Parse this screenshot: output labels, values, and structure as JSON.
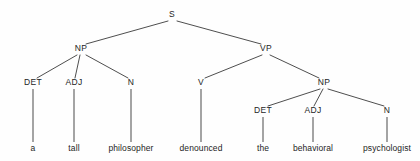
{
  "figure": {
    "sentence": "a tall philosopher denounced the behavioral psychologist",
    "background_color": "#fefefe",
    "line_color": "#3a3a3a",
    "text_color": "#1d1d1d"
  },
  "nodes": {
    "s": {
      "label": "S",
      "x": 172,
      "y": 17
    },
    "np_subject": {
      "label": "NP",
      "x": 81,
      "y": 51
    },
    "vp": {
      "label": "VP",
      "x": 266,
      "y": 51
    },
    "det_left": {
      "label": "DET",
      "x": 33,
      "y": 85
    },
    "adj_left": {
      "label": "ADJ",
      "x": 74,
      "y": 85
    },
    "n_left": {
      "label": "N",
      "x": 131,
      "y": 85
    },
    "v": {
      "label": "V",
      "x": 201,
      "y": 85
    },
    "np_object": {
      "label": "NP",
      "x": 324,
      "y": 85
    },
    "det_right": {
      "label": "DET",
      "x": 263,
      "y": 113
    },
    "adj_right": {
      "label": "ADJ",
      "x": 313,
      "y": 113
    },
    "n_right": {
      "label": "N",
      "x": 387,
      "y": 113
    }
  },
  "leaves": [
    {
      "label": "a",
      "x": 33,
      "y": 151
    },
    {
      "label": "tall",
      "x": 74,
      "y": 151
    },
    {
      "label": "philosopher",
      "x": 131,
      "y": 151
    },
    {
      "label": "denounced",
      "x": 201,
      "y": 151
    },
    {
      "label": "the",
      "x": 263,
      "y": 151
    },
    {
      "label": "behavioral",
      "x": 313,
      "y": 151
    },
    {
      "label": "psychologist",
      "x": 387,
      "y": 151
    }
  ],
  "edges": [
    {
      "from": "s",
      "to": "np_subject",
      "x1": 168,
      "y1": 21,
      "x2": 86,
      "y2": 44
    },
    {
      "from": "s",
      "to": "vp",
      "x1": 177,
      "y1": 21,
      "x2": 261,
      "y2": 44
    },
    {
      "from": "np_subject",
      "to": "det_left",
      "x1": 77,
      "y1": 55,
      "x2": 37,
      "y2": 78
    },
    {
      "from": "np_subject",
      "to": "adj_left",
      "x1": 80,
      "y1": 55,
      "x2": 75,
      "y2": 78
    },
    {
      "from": "np_subject",
      "to": "n_left",
      "x1": 86,
      "y1": 55,
      "x2": 128,
      "y2": 78
    },
    {
      "from": "vp",
      "to": "v",
      "x1": 262,
      "y1": 55,
      "x2": 205,
      "y2": 78
    },
    {
      "from": "vp",
      "to": "np_object",
      "x1": 270,
      "y1": 55,
      "x2": 319,
      "y2": 78
    },
    {
      "from": "np_object",
      "to": "det_right",
      "x1": 320,
      "y1": 89,
      "x2": 268,
      "y2": 106
    },
    {
      "from": "np_object",
      "to": "adj_right",
      "x1": 323,
      "y1": 89,
      "x2": 314,
      "y2": 106
    },
    {
      "from": "np_object",
      "to": "n_right",
      "x1": 328,
      "y1": 89,
      "x2": 384,
      "y2": 106
    }
  ],
  "stems": [
    {
      "parent": "det_left",
      "x": 33,
      "y1": 89,
      "y2": 142
    },
    {
      "parent": "adj_left",
      "x": 74,
      "y1": 89,
      "y2": 142
    },
    {
      "parent": "n_left",
      "x": 131,
      "y1": 89,
      "y2": 142
    },
    {
      "parent": "v",
      "x": 201,
      "y1": 89,
      "y2": 142
    },
    {
      "parent": "det_right",
      "x": 263,
      "y1": 117,
      "y2": 142
    },
    {
      "parent": "adj_right",
      "x": 313,
      "y1": 117,
      "y2": 142
    },
    {
      "parent": "n_right",
      "x": 387,
      "y1": 117,
      "y2": 142
    }
  ]
}
